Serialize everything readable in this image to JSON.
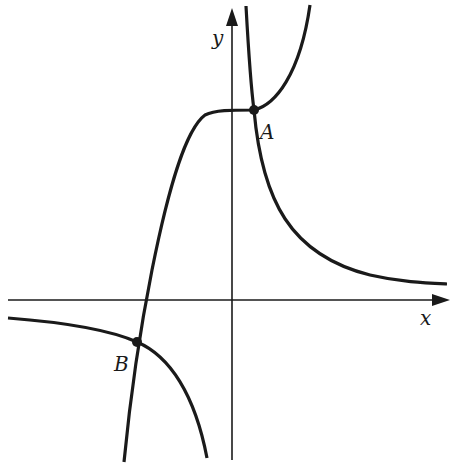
{
  "diagram": {
    "type": "function-graph",
    "axes": {
      "x_label": "x",
      "y_label": "y",
      "origin_px": [
        232,
        300
      ]
    },
    "curves": [
      {
        "name": "cubic-curve",
        "description": "increasing curve with flat inflection near A, passes through B"
      },
      {
        "name": "hyperbola",
        "description": "two branches in quadrants I and III, passes through A and B"
      }
    ],
    "points": [
      {
        "label": "A",
        "px": [
          254,
          110
        ]
      },
      {
        "label": "B",
        "px": [
          137,
          342
        ]
      }
    ],
    "colors": {
      "stroke": "#1a1a1a",
      "background": "#ffffff"
    }
  }
}
